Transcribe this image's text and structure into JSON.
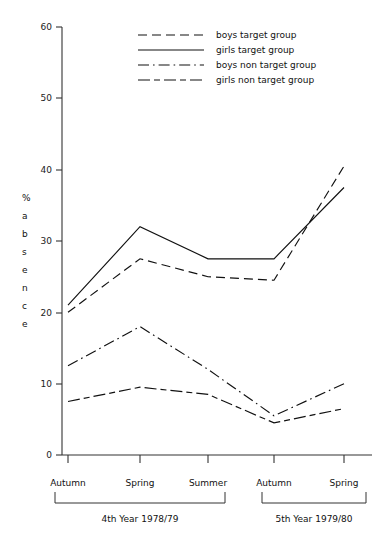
{
  "chart_data": {
    "type": "line",
    "title": "",
    "xlabel": "",
    "ylabel": "% absence",
    "ylim": [
      0,
      60
    ],
    "yticks": [
      0,
      10,
      20,
      30,
      40,
      50,
      60
    ],
    "grid": false,
    "legend_position": "top-center",
    "categories": [
      "Autumn",
      "Spring",
      "Summer",
      "Autumn",
      "Spring"
    ],
    "category_groups": [
      {
        "label": "4th Year 1978/79",
        "categories": [
          "Autumn",
          "Spring",
          "Summer"
        ]
      },
      {
        "label": "5th Year 1979/80",
        "categories": [
          "Autumn",
          "Spring"
        ]
      }
    ],
    "series": [
      {
        "name": "boys  target group",
        "style": "dashed",
        "values": [
          20,
          27.5,
          25,
          24.5,
          40.5
        ]
      },
      {
        "name": "girls target group",
        "style": "solid",
        "values": [
          21,
          32,
          27.5,
          27.5,
          37.5
        ]
      },
      {
        "name": "boys  non target group",
        "style": "dash-dot",
        "values": [
          12.5,
          18,
          12,
          5.5,
          10
        ]
      },
      {
        "name": "girls non target group",
        "style": "dash-dash",
        "values": [
          7.5,
          9.5,
          8.5,
          4.5,
          6.5
        ]
      }
    ]
  },
  "axis": {
    "y_tick_0": "0",
    "y_tick_10": "10",
    "y_tick_20": "20",
    "y_tick_30": "30",
    "y_tick_40": "40",
    "y_tick_50": "50",
    "y_tick_60": "60"
  },
  "ylabel_chars": [
    "%",
    "a",
    "b",
    "s",
    "e",
    "n",
    "c",
    "e"
  ],
  "legend": {
    "items": [
      {
        "label": "boys  target group",
        "style": "dashed"
      },
      {
        "label": "girls target group",
        "style": "solid"
      },
      {
        "label": "boys  non target group",
        "style": "dash-dot"
      },
      {
        "label": "girls non target group",
        "style": "dash-dash"
      }
    ]
  },
  "x_categories": [
    {
      "label": "Autumn"
    },
    {
      "label": "Spring"
    },
    {
      "label": "Summer"
    },
    {
      "label": "Autumn"
    },
    {
      "label": "Spring"
    }
  ],
  "group_labels": [
    {
      "label": "4th Year 1978/79"
    },
    {
      "label": "5th Year 1979/80"
    }
  ]
}
